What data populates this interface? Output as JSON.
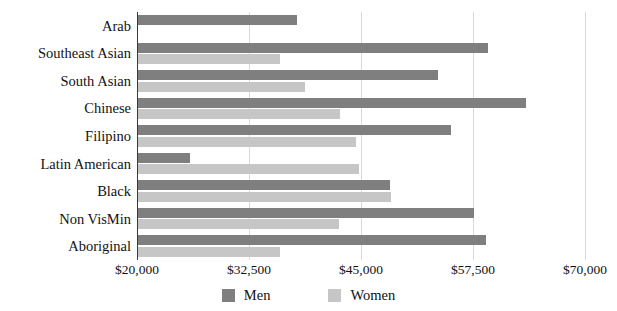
{
  "chart_data": {
    "type": "bar",
    "orientation": "horizontal",
    "title": "",
    "xlabel": "",
    "ylabel": "",
    "xlim": [
      20000,
      70000
    ],
    "xticks": [
      "$20,000",
      "$32,500",
      "$45,000",
      "$57,500",
      "$70,000"
    ],
    "xtick_values": [
      20000,
      32500,
      45000,
      57500,
      70000
    ],
    "grid": true,
    "legend_position": "bottom",
    "categories": [
      "Arab",
      "Southeast Asian",
      "South Asian",
      "Chinese",
      "Filipino",
      "Latin American",
      "Black",
      "Non VisMin",
      "Aboriginal"
    ],
    "series": [
      {
        "name": "Men",
        "color": "#7f7f7f",
        "values": [
          37900,
          59200,
          53600,
          63400,
          55100,
          25900,
          48200,
          57600,
          58900
        ]
      },
      {
        "name": "Women",
        "color": "#c6c6c6",
        "values": [
          20000,
          36000,
          38700,
          42700,
          44400,
          44800,
          48300,
          42600,
          36000
        ]
      }
    ]
  },
  "legend": {
    "items": [
      {
        "label": "Men",
        "color": "#7f7f7f",
        "swatch": "men"
      },
      {
        "label": "Women",
        "color": "#c6c6c6",
        "swatch": "women"
      }
    ]
  }
}
